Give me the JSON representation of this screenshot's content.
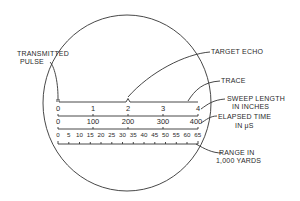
{
  "diagram": {
    "colors": {
      "ink": "#333333",
      "background": "#ffffff"
    },
    "callouts": {
      "transmitted_pulse": [
        "TRANSMITTED",
        "PULSE"
      ],
      "target_echo": "TARGET ECHO",
      "trace": "TRACE",
      "sweep_length": [
        "SWEEP LENGTH",
        "IN INCHES"
      ],
      "elapsed_time": [
        "ELAPSED TIME",
        "IN μS"
      ],
      "range": [
        "RANGE IN",
        "1,000 YARDS"
      ]
    },
    "scales": {
      "sweep_length_inches": [
        "0",
        "1",
        "2",
        "3",
        "4"
      ],
      "elapsed_time_us": [
        "0",
        "100",
        "200",
        "300",
        "400"
      ],
      "range_kyd": [
        "0",
        "5",
        "10",
        "15",
        "20",
        "25",
        "30",
        "35",
        "40",
        "45",
        "50",
        "55",
        "60",
        "65"
      ]
    }
  }
}
